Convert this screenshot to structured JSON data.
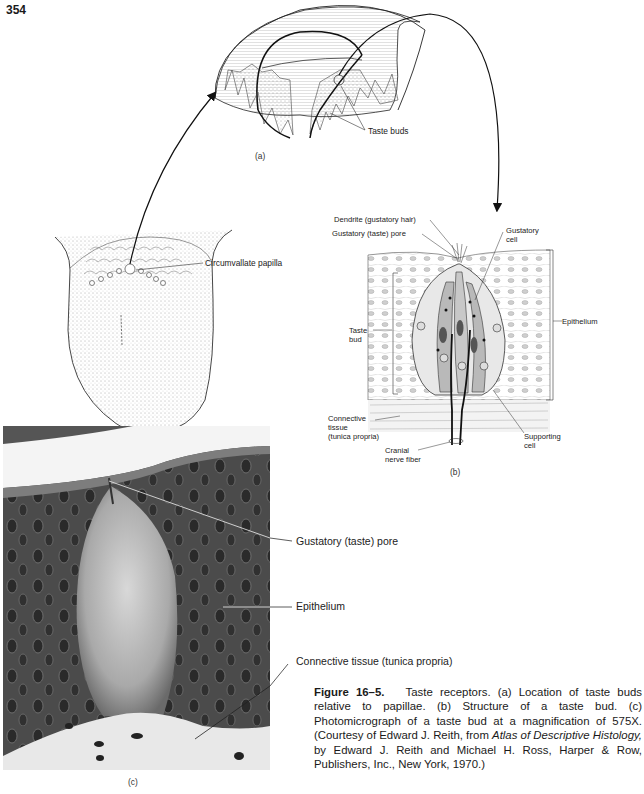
{
  "page": {
    "page_number": "354"
  },
  "figure": {
    "panel_a": {
      "letter": "(a)",
      "labels": {
        "taste_buds": "Taste buds"
      }
    },
    "tongue": {
      "labels": {
        "circumvallate_papilla": "Circumvallate papilla"
      }
    },
    "panel_b": {
      "letter": "(b)",
      "labels": {
        "dendrite": "Dendrite (gustatory hair)",
        "pore": "Gustatory (taste) pore",
        "gustatory_cell_1": "Gustatory",
        "gustatory_cell_2": "cell",
        "epithelium": "Epithelium",
        "taste_bud_1": "Taste",
        "taste_bud_2": "bud",
        "connective_1": "Connective",
        "connective_2": "tissue",
        "connective_3": "(tunica propria)",
        "cranial_1": "Cranial",
        "cranial_2": "nerve fiber",
        "supporting_1": "Supporting",
        "supporting_2": "cell"
      }
    },
    "panel_c": {
      "letter": "(c)",
      "labels": {
        "pore": "Gustatory (taste) pore",
        "epithelium": "Epithelium",
        "connective": "Connective tissue (tunica propria)"
      }
    },
    "caption": {
      "figure_label": "Figure 16–5.",
      "text_1": "Taste receptors. (a) Location of taste buds relative to papillae. (b) Structure of a taste bud. (c) Photomicrograph of a taste bud at a magnification of 575X. (Courtesy of Edward J. Reith, from ",
      "book_title": "Atlas of Descriptive Histology,",
      "text_2": " by Edward J. Reith and Michael H. Ross, Harper & Row, Publishers, Inc., New York, 1970.)"
    }
  }
}
